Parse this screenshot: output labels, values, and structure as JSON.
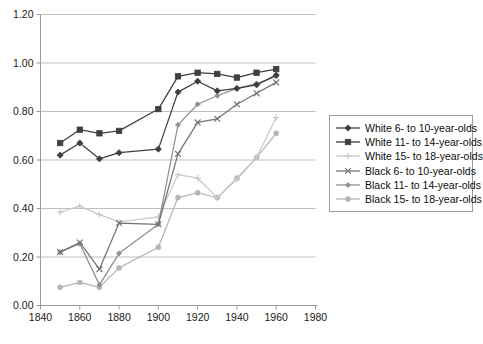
{
  "chart_data": {
    "type": "line",
    "title": "",
    "xlabel": "",
    "ylabel": "",
    "xlim": [
      1840,
      1980
    ],
    "ylim": [
      0.0,
      1.2
    ],
    "x_ticks": [
      "1840",
      "1860",
      "1880",
      "1900",
      "1920",
      "1940",
      "1960",
      "1980"
    ],
    "y_ticks": [
      "0.00",
      "0.20",
      "0.40",
      "0.60",
      "0.80",
      "1.00",
      "1.20"
    ],
    "x": [
      1850,
      1860,
      1870,
      1880,
      1890,
      1900,
      1910,
      1920,
      1930,
      1940,
      1950,
      1960
    ],
    "grid": "horizontal",
    "legend_position": "right",
    "series": [
      {
        "name": "White 6- to 10-year-olds",
        "color": "#3f3f3f",
        "marker": "diamond",
        "values": [
          0.62,
          0.67,
          0.605,
          0.63,
          null,
          0.645,
          0.88,
          0.925,
          0.885,
          0.895,
          0.91,
          0.95
        ]
      },
      {
        "name": "White 11- to 14-year-olds",
        "color": "#3f3f3f",
        "marker": "square",
        "values": [
          0.67,
          0.725,
          0.71,
          0.72,
          null,
          0.81,
          0.945,
          0.96,
          0.955,
          0.94,
          0.96,
          0.975
        ]
      },
      {
        "name": "White 15- to 18-year-olds",
        "color": "#c9c9c9",
        "marker": "plus",
        "values": [
          0.385,
          0.41,
          0.375,
          0.345,
          null,
          0.365,
          0.54,
          0.525,
          0.445,
          0.52,
          0.61,
          0.775
        ]
      },
      {
        "name": "Black 6- to 10-year-olds",
        "color": "#737373",
        "marker": "x",
        "values": [
          0.22,
          0.26,
          0.15,
          0.34,
          null,
          0.335,
          0.625,
          0.755,
          0.77,
          0.83,
          0.875,
          0.92
        ]
      },
      {
        "name": "Black 11- to 14-year-olds",
        "color": "#8f8f8f",
        "marker": "dash",
        "values": [
          0.22,
          0.255,
          0.085,
          0.215,
          null,
          0.335,
          0.745,
          0.83,
          0.865,
          0.895,
          0.915,
          0.945
        ]
      },
      {
        "name": "Black 15- to 18-year-olds",
        "color": "#b5b5b5",
        "marker": "circle",
        "values": [
          0.075,
          0.095,
          0.075,
          0.155,
          null,
          0.24,
          0.445,
          0.465,
          0.445,
          0.525,
          0.61,
          0.71
        ]
      }
    ]
  },
  "axis": {
    "frame_color": "#9a9a9a",
    "gridline_color": "#bfbfbf"
  }
}
